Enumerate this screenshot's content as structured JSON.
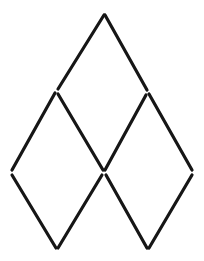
{
  "figure": {
    "background_color": "#ffffff",
    "stroke_color": "#161616",
    "stroke_width": 3.2,
    "canvas": {
      "width": 204,
      "height": 261
    },
    "vertices": {
      "top_apex": {
        "name": "top-apex",
        "x": 104,
        "y": 15
      },
      "upper_left": {
        "name": "upper-left",
        "x": 57,
        "y": 91
      },
      "upper_right": {
        "name": "upper-right",
        "x": 148,
        "y": 92
      },
      "far_left": {
        "name": "far-left",
        "x": 11,
        "y": 172
      },
      "center": {
        "name": "center",
        "x": 104,
        "y": 172
      },
      "far_right": {
        "name": "far-right",
        "x": 193,
        "y": 172
      },
      "bottom_left": {
        "name": "bottom-left",
        "x": 57,
        "y": 249
      },
      "bottom_right": {
        "name": "bottom-right",
        "x": 148,
        "y": 249
      }
    },
    "edges": [
      {
        "name": "edge-apex-to-upper-left",
        "x1": 104,
        "y1": 15,
        "x2": 58,
        "y2": 89
      },
      {
        "name": "edge-apex-to-upper-right",
        "x1": 105,
        "y1": 15,
        "x2": 147,
        "y2": 90
      },
      {
        "name": "edge-upper-left-to-far-left",
        "x1": 55,
        "y1": 93,
        "x2": 12,
        "y2": 170
      },
      {
        "name": "edge-upper-left-to-center",
        "x1": 58,
        "y1": 94,
        "x2": 103,
        "y2": 170
      },
      {
        "name": "edge-upper-right-to-center",
        "x1": 146,
        "y1": 95,
        "x2": 105,
        "y2": 170
      },
      {
        "name": "edge-upper-right-to-far-right",
        "x1": 149,
        "y1": 94,
        "x2": 192,
        "y2": 170
      },
      {
        "name": "edge-far-left-to-bottom-left",
        "x1": 12,
        "y1": 175,
        "x2": 56,
        "y2": 248
      },
      {
        "name": "edge-center-to-bottom-left",
        "x1": 102,
        "y1": 175,
        "x2": 58,
        "y2": 248
      },
      {
        "name": "edge-center-to-bottom-right",
        "x1": 106,
        "y1": 175,
        "x2": 147,
        "y2": 248
      },
      {
        "name": "edge-far-right-to-bottom-right",
        "x1": 192,
        "y1": 175,
        "x2": 149,
        "y2": 248
      }
    ],
    "rhombi": [
      {
        "name": "rhombus-top",
        "vertices": [
          "top-apex",
          "upper-right",
          "center",
          "upper-left"
        ]
      },
      {
        "name": "rhombus-lower-left",
        "vertices": [
          "upper-left",
          "center",
          "bottom-left",
          "far-left"
        ]
      },
      {
        "name": "rhombus-lower-right",
        "vertices": [
          "upper-right",
          "far-right",
          "bottom-right",
          "center"
        ]
      }
    ],
    "counts": {
      "edges": 10,
      "vertices": 8,
      "rhombi": 3
    }
  }
}
